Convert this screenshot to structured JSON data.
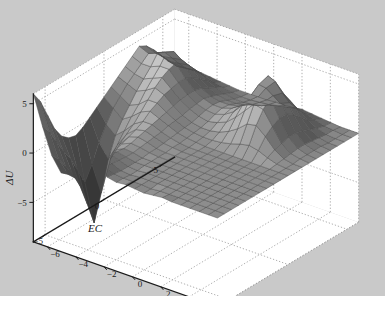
{
  "figure": {
    "background_color": "#c9c9c9",
    "plot_background_color": "#ffffff",
    "page_background_color": "#ffffff",
    "axis_color": "#1a1a1a",
    "grid_color": "#9a9a9a",
    "mesh_edge_color": "#4a4a4a"
  },
  "chart_data": {
    "type": "surface",
    "title": "",
    "xlabel": "E",
    "ylabel": "EC",
    "zlabel": "ΔU",
    "xlim": [
      -7,
      6
    ],
    "ylim": [
      -6,
      6
    ],
    "zlim": [
      -9,
      6
    ],
    "xticks": [
      -6,
      -4,
      -2,
      0,
      2,
      4,
      6
    ],
    "xticklabels": [
      "−6",
      "−4",
      "−2",
      "0",
      "2",
      "4",
      "6"
    ],
    "yticks": [
      -5,
      0,
      5
    ],
    "yticklabels": [
      "−5",
      "0",
      "5"
    ],
    "zticks": [
      -5,
      0,
      5
    ],
    "zticklabels": [
      "−5",
      "0",
      "5"
    ],
    "grid": true,
    "grid_style": "dotted",
    "colormap": "gray",
    "shading": "faceted",
    "legend": null,
    "view": {
      "azimuth": -37.5,
      "elevation": 30
    },
    "x": [
      -7,
      -6.35,
      -5.7,
      -5.05,
      -4.4,
      -3.75,
      -3.1,
      -2.45,
      -1.8,
      -1.15,
      -0.5,
      0.15,
      0.8,
      1.45,
      2.1,
      2.75,
      3.4,
      4.05,
      4.7,
      5.35,
      6
    ],
    "y": [
      -6,
      -5.4,
      -4.8,
      -4.2,
      -3.6,
      -3,
      -2.4,
      -1.8,
      -1.2,
      -0.6,
      0,
      0.6,
      1.2,
      1.8,
      2.4,
      3,
      3.6,
      4.2,
      4.8,
      5.4,
      6
    ],
    "z_description": "Irregular energy-difference surface: a tall sharp peak near (E=3.5, EC=4), a second peak near (E=-3, EC=4), a very deep narrow trough plunging to about -9 near (E=-5.5, EC=-1), a raised ridge along the far-left EC edge reaching +6, and a broad nearly flat plateau near 0 over most of the positive-E / negative-EC region.",
    "z": [
      [
        6.0,
        3.0,
        0.4,
        -1.0,
        -0.4,
        0.6,
        1.2,
        0.8,
        0.2,
        0.0,
        0.1,
        0.0,
        -0.1,
        0.0,
        0.1,
        0.0,
        0.0,
        0.0,
        0.0,
        0.0,
        0.0
      ],
      [
        4.8,
        2.0,
        -0.4,
        -1.6,
        -0.8,
        0.4,
        1.0,
        0.6,
        0.1,
        0.0,
        0.0,
        0.0,
        -0.1,
        0.0,
        0.0,
        0.0,
        0.0,
        0.0,
        0.0,
        0.0,
        0.0
      ],
      [
        3.0,
        0.6,
        -1.6,
        -2.4,
        -1.2,
        0.2,
        0.8,
        0.4,
        0.0,
        -0.1,
        0.0,
        0.0,
        0.0,
        0.0,
        0.0,
        0.0,
        0.0,
        0.0,
        0.0,
        0.0,
        0.0
      ],
      [
        1.2,
        -0.8,
        -2.8,
        -3.0,
        -1.6,
        0.0,
        0.6,
        0.3,
        0.0,
        -0.1,
        0.0,
        0.0,
        0.0,
        0.0,
        0.0,
        0.0,
        0.0,
        0.0,
        0.0,
        0.0,
        0.0
      ],
      [
        0.0,
        -2.0,
        -4.4,
        -3.4,
        -1.8,
        -0.2,
        0.4,
        0.2,
        0.0,
        0.0,
        0.0,
        0.0,
        0.0,
        0.0,
        0.0,
        0.0,
        0.0,
        0.0,
        0.0,
        0.0,
        0.0
      ],
      [
        -0.6,
        -3.6,
        -6.6,
        -3.6,
        -1.6,
        -0.2,
        0.3,
        0.2,
        0.0,
        0.0,
        0.0,
        0.0,
        0.0,
        0.0,
        0.0,
        0.0,
        0.0,
        0.0,
        0.0,
        0.0,
        0.0
      ],
      [
        -0.8,
        -5.2,
        -9.0,
        -3.4,
        -1.2,
        0.0,
        0.4,
        0.3,
        0.1,
        0.0,
        0.0,
        0.0,
        0.0,
        0.0,
        0.0,
        0.0,
        0.0,
        0.0,
        0.0,
        0.0,
        0.0
      ],
      [
        -0.4,
        -3.8,
        -6.4,
        -2.6,
        -0.8,
        0.3,
        0.6,
        0.4,
        0.1,
        0.0,
        0.0,
        0.0,
        0.0,
        0.0,
        0.0,
        0.0,
        0.0,
        0.0,
        0.0,
        0.0,
        0.0
      ],
      [
        0.2,
        -2.0,
        -3.4,
        -1.6,
        -0.2,
        0.6,
        0.8,
        0.5,
        0.2,
        0.1,
        0.0,
        0.0,
        0.0,
        0.0,
        0.0,
        0.0,
        0.0,
        0.0,
        0.0,
        0.0,
        0.0
      ],
      [
        0.8,
        -0.6,
        -1.4,
        -0.6,
        0.4,
        1.0,
        1.0,
        0.6,
        0.3,
        0.1,
        0.0,
        0.0,
        0.0,
        0.0,
        0.0,
        0.0,
        0.0,
        0.0,
        0.0,
        0.0,
        0.0
      ],
      [
        1.4,
        0.6,
        -0.2,
        0.4,
        1.2,
        1.6,
        1.2,
        0.8,
        0.4,
        0.2,
        0.1,
        0.0,
        0.0,
        0.0,
        0.0,
        0.0,
        0.0,
        0.0,
        0.0,
        0.0,
        0.0
      ],
      [
        2.0,
        1.4,
        0.8,
        1.2,
        2.0,
        2.0,
        1.4,
        0.9,
        0.5,
        0.3,
        0.2,
        0.2,
        0.3,
        0.5,
        0.8,
        1.0,
        0.8,
        0.4,
        0.1,
        0.0,
        0.0
      ],
      [
        2.6,
        2.2,
        1.8,
        2.2,
        2.8,
        2.4,
        1.6,
        1.0,
        0.6,
        0.4,
        0.4,
        0.6,
        1.0,
        1.6,
        2.4,
        2.6,
        1.8,
        0.8,
        0.2,
        0.0,
        0.0
      ],
      [
        3.2,
        2.8,
        2.6,
        3.0,
        3.4,
        2.6,
        1.8,
        1.2,
        0.8,
        0.6,
        0.8,
        1.2,
        2.0,
        3.0,
        4.0,
        3.8,
        2.4,
        1.0,
        0.3,
        0.1,
        0.0
      ],
      [
        3.8,
        3.4,
        3.4,
        3.8,
        3.8,
        2.8,
        1.9,
        1.3,
        1.0,
        0.9,
        1.2,
        1.8,
        2.8,
        4.2,
        5.4,
        4.6,
        2.8,
        1.2,
        0.4,
        0.1,
        0.0
      ],
      [
        4.4,
        4.0,
        4.4,
        4.8,
        4.0,
        2.8,
        1.9,
        1.4,
        1.1,
        1.1,
        1.4,
        2.0,
        3.2,
        4.8,
        6.0,
        4.8,
        2.8,
        1.2,
        0.4,
        0.1,
        0.0
      ],
      [
        4.0,
        3.6,
        4.0,
        4.4,
        3.6,
        2.4,
        1.7,
        1.2,
        1.0,
        1.0,
        1.2,
        1.7,
        2.6,
        4.0,
        5.0,
        4.0,
        2.3,
        1.0,
        0.3,
        0.1,
        0.0
      ],
      [
        3.2,
        2.8,
        3.0,
        3.2,
        2.8,
        1.9,
        1.3,
        0.9,
        0.7,
        0.7,
        0.9,
        1.2,
        1.8,
        2.8,
        3.4,
        2.8,
        1.6,
        0.7,
        0.2,
        0.0,
        0.0
      ],
      [
        2.2,
        1.9,
        2.0,
        2.2,
        1.9,
        1.3,
        0.9,
        0.6,
        0.4,
        0.4,
        0.5,
        0.7,
        1.1,
        1.6,
        2.0,
        1.6,
        0.9,
        0.4,
        0.1,
        0.0,
        0.0
      ],
      [
        1.2,
        1.0,
        1.1,
        1.2,
        1.0,
        0.7,
        0.5,
        0.3,
        0.2,
        0.2,
        0.3,
        0.4,
        0.6,
        0.8,
        1.0,
        0.8,
        0.5,
        0.2,
        0.1,
        0.0,
        0.0
      ],
      [
        0.5,
        0.4,
        0.5,
        0.5,
        0.4,
        0.3,
        0.2,
        0.1,
        0.1,
        0.1,
        0.1,
        0.2,
        0.2,
        0.3,
        0.4,
        0.3,
        0.2,
        0.1,
        0.0,
        0.0,
        0.0
      ]
    ]
  }
}
